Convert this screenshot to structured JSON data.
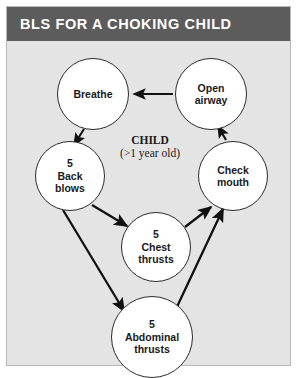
{
  "card": {
    "title": "BLS FOR A CHOKING CHILD",
    "background_color": "#e4e4e4",
    "title_bar_color": "#5c5c5c",
    "title_text_color": "#ffffff",
    "border_color": "#b9b9b9"
  },
  "diagram": {
    "type": "flowchart",
    "center_label": {
      "title": "CHILD",
      "subtitle": "(>1 year old)"
    },
    "node_fill_color": "#ffffff",
    "node_border_color": "#2b2b2b",
    "arrow_color": "#111111",
    "nodes": [
      {
        "id": "breathe",
        "label": "Breathe"
      },
      {
        "id": "open_airway",
        "label": "Open\nairway"
      },
      {
        "id": "back_blows",
        "label": "5\nBack\nblows"
      },
      {
        "id": "check_mouth",
        "label": "Check\nmouth"
      },
      {
        "id": "chest_thrusts",
        "label": "5\nChest\nthrusts"
      },
      {
        "id": "abdominal_thrusts",
        "label": "5\nAbdominal\nthrusts"
      }
    ],
    "edges": [
      {
        "from": "open_airway",
        "to": "breathe"
      },
      {
        "from": "breathe",
        "to": "back_blows"
      },
      {
        "from": "back_blows",
        "to": "chest_thrusts"
      },
      {
        "from": "back_blows",
        "to": "abdominal_thrusts"
      },
      {
        "from": "chest_thrusts",
        "to": "check_mouth"
      },
      {
        "from": "abdominal_thrusts",
        "to": "check_mouth"
      },
      {
        "from": "check_mouth",
        "to": "open_airway"
      }
    ]
  }
}
